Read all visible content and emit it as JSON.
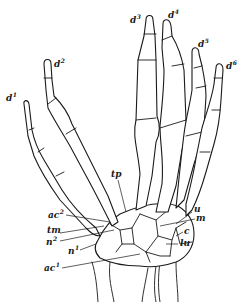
{
  "figure": {
    "background": "#ffffff",
    "line_color": "#1a1a1a"
  },
  "labels": {
    "d1": {
      "base": "d",
      "sup": "1"
    },
    "d2": {
      "base": "d",
      "sup": "2"
    },
    "d3": {
      "base": "d",
      "sup": "3"
    },
    "d4": {
      "base": "d",
      "sup": "4"
    },
    "d5": {
      "base": "d",
      "sup": "5"
    },
    "d6": {
      "base": "d",
      "sup": "6"
    },
    "tp": {
      "base": "tp",
      "sup": ""
    },
    "ac2": {
      "base": "ac",
      "sup": "2"
    },
    "tm": {
      "base": "tm",
      "sup": ""
    },
    "n2": {
      "base": "n",
      "sup": "2"
    },
    "n1": {
      "base": "n",
      "sup": "1"
    },
    "ac1": {
      "base": "ac",
      "sup": "1"
    },
    "u": {
      "base": "u",
      "sup": ""
    },
    "m": {
      "base": "m",
      "sup": ""
    },
    "c": {
      "base": "c",
      "sup": ""
    },
    "lu": {
      "base": "lu",
      "sup": ""
    }
  }
}
